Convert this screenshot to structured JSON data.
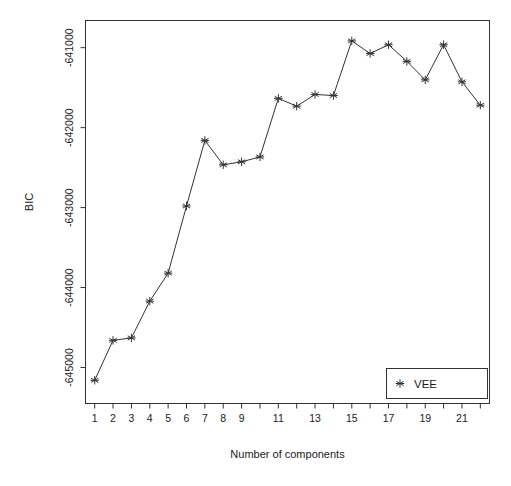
{
  "chart_data": {
    "type": "line",
    "title": "",
    "xlabel": "Number of components",
    "ylabel": "BIC",
    "x": [
      1,
      2,
      3,
      4,
      5,
      6,
      7,
      8,
      9,
      10,
      11,
      12,
      13,
      14,
      15,
      16,
      17,
      18,
      19,
      20,
      21,
      22
    ],
    "xtick_values": [
      1,
      2,
      3,
      4,
      5,
      6,
      7,
      8,
      9,
      10,
      11,
      12,
      13,
      14,
      15,
      16,
      17,
      18,
      19,
      20,
      21,
      22
    ],
    "xtick_labels": [
      "1",
      "2",
      "3",
      "4",
      "5",
      "6",
      "7",
      "8",
      "9",
      "",
      "11",
      "",
      "13",
      "",
      "15",
      "",
      "17",
      "",
      "19",
      "",
      "21",
      ""
    ],
    "xlim": [
      0.5,
      22.5
    ],
    "ytick_values": [
      -641000,
      -642000,
      -643000,
      -644000,
      -645000
    ],
    "ytick_labels": [
      "-641000",
      "-642000",
      "-643000",
      "-644000",
      "-645000"
    ],
    "ylim": [
      -645450,
      -640660
    ],
    "grid": false,
    "legend_position": "bottom-right",
    "series": [
      {
        "name": "VEE",
        "marker": "asterisk",
        "line_style": "solid",
        "color": "#333333",
        "values": [
          -645160,
          -644660,
          -644630,
          -644170,
          -643820,
          -642980,
          -642160,
          -642465,
          -642427,
          -642366,
          -641634,
          -641732,
          -641585,
          -641598,
          -640915,
          -641073,
          -640963,
          -641171,
          -641402,
          -640963,
          -641427,
          -641720
        ]
      }
    ]
  },
  "legend": {
    "entries": [
      {
        "label": "VEE",
        "marker": "asterisk"
      }
    ]
  },
  "axes": {
    "x_title": "Number of components",
    "y_title": "BIC"
  },
  "style": {
    "background": "#ffffff",
    "axis_color": "#333333",
    "text_color": "#1a1a1a",
    "series_color": "#333333"
  }
}
